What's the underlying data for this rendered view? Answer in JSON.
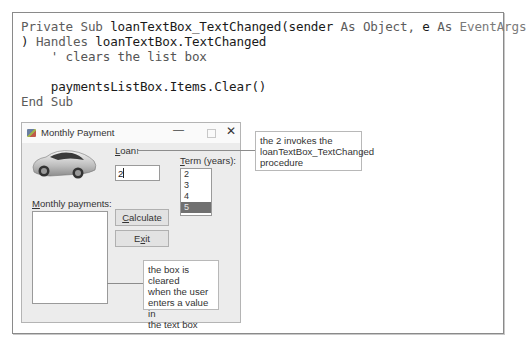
{
  "code": {
    "lines": [
      [
        {
          "t": "Private Sub ",
          "c": "kw"
        },
        {
          "t": "loanTextBox_TextChanged(sender ",
          "c": "id"
        },
        {
          "t": "As Object, ",
          "c": "kw"
        },
        {
          "t": "e ",
          "c": "id"
        },
        {
          "t": "As ",
          "c": "kw"
        },
        {
          "t": "EventArgs",
          "c": "type"
        }
      ],
      [
        {
          "t": ") ",
          "c": "id"
        },
        {
          "t": "Handles ",
          "c": "kw"
        },
        {
          "t": "loanTextBox.TextChanged",
          "c": "id"
        }
      ],
      [
        {
          "t": "    ' clears the list box",
          "c": "cm"
        }
      ],
      [
        {
          "t": "",
          "c": "id"
        }
      ],
      [
        {
          "t": "    paymentsListBox.Items.Clear()",
          "c": "id"
        }
      ],
      [
        {
          "t": "End Sub",
          "c": "kw"
        }
      ]
    ]
  },
  "dialog": {
    "title": "Monthly Payment",
    "minimize_glyph": "—",
    "close_glyph": "✕",
    "loan_label_accel": "L",
    "loan_label_rest": "oan:",
    "loan_value": "2",
    "term_label_accel": "T",
    "term_label_rest": "erm (years):",
    "term_items": [
      "2",
      "3",
      "4",
      "5"
    ],
    "term_selected": "5",
    "monthly_label_accel": "M",
    "monthly_label_rest": "onthly payments:",
    "calculate_accel": "C",
    "calculate_rest": "alculate",
    "exit_pre": "E",
    "exit_accel": "x",
    "exit_post": "it"
  },
  "callouts": {
    "top": [
      "the 2 invokes the",
      "loanTextBox_TextChanged",
      "procedure"
    ],
    "bottom": [
      "the box is cleared",
      "when the user",
      "enters a value in",
      "the text box"
    ]
  },
  "colors": {
    "selected_item_bg": "#707070",
    "dialog_bg": "#ececec",
    "frame_border": "#8a8a8a"
  }
}
